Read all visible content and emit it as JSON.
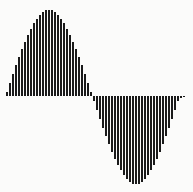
{
  "chart_data": {
    "type": "bar",
    "title": "",
    "subtitle": "",
    "xlabel": "",
    "ylabel": "",
    "grid": false,
    "legend": null,
    "legend_position": "none",
    "axis_visible": false,
    "tick_labels_x": [],
    "tick_labels_y": [],
    "xlim": [
      0,
      1
    ],
    "ylim": [
      -1,
      1
    ],
    "bar_color": "#1a1a1a",
    "background_color": "#fbfbfa",
    "baseline": 0,
    "categories": [
      "0",
      "1",
      "2",
      "3",
      "4",
      "5",
      "6",
      "7",
      "8",
      "9",
      "10",
      "11",
      "12",
      "13",
      "14",
      "15",
      "16",
      "17",
      "18",
      "19",
      "20",
      "21",
      "22",
      "23",
      "24",
      "25",
      "26",
      "27",
      "28",
      "29",
      "30",
      "31",
      "32",
      "33",
      "34",
      "35",
      "36",
      "37",
      "38",
      "39",
      "40",
      "41",
      "42",
      "43",
      "44",
      "45",
      "46",
      "47",
      "48",
      "49",
      "50",
      "51",
      "52",
      "53",
      "54",
      "55",
      "56",
      "57",
      "58",
      "59"
    ],
    "values": [
      0.052,
      0.156,
      0.259,
      0.358,
      0.454,
      0.545,
      0.631,
      0.711,
      0.782,
      0.846,
      0.901,
      0.947,
      0.982,
      0.998,
      1.0,
      0.998,
      0.982,
      0.947,
      0.901,
      0.846,
      0.782,
      0.711,
      0.631,
      0.545,
      0.454,
      0.358,
      0.259,
      0.156,
      0.052,
      -0.052,
      -0.156,
      -0.259,
      -0.358,
      -0.454,
      -0.545,
      -0.631,
      -0.711,
      -0.782,
      -0.846,
      -0.901,
      -0.947,
      -0.982,
      -0.998,
      -1.0,
      -0.998,
      -0.982,
      -0.947,
      -0.901,
      -0.846,
      -0.782,
      -0.711,
      -0.631,
      -0.545,
      -0.454,
      -0.358,
      -0.259,
      -0.156,
      -0.052,
      -0.026,
      -0.01
    ]
  },
  "geometry": {
    "canvas_width": 193,
    "canvas_height": 192,
    "plot_left": 6,
    "plot_right": 186,
    "baseline_y": 96,
    "amplitude_up": 86,
    "amplitude_down": 88,
    "bar_width": 2,
    "bar_pitch": 3
  }
}
